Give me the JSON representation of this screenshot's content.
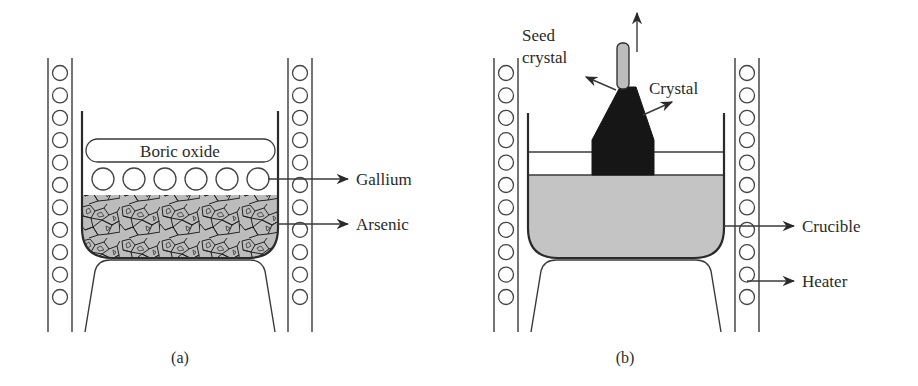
{
  "figure": {
    "panels": [
      {
        "id": "a",
        "caption": "(a)",
        "labels": {
          "boric_oxide": "Boric oxide",
          "gallium": "Gallium",
          "arsenic": "Arsenic"
        }
      },
      {
        "id": "b",
        "caption": "(b)",
        "labels": {
          "seed_line1": "Seed",
          "seed_line2": "crystal",
          "crystal": "Crystal",
          "crucible": "Crucible",
          "heater": "Heater"
        }
      }
    ],
    "heater_coil_count": 11,
    "gallium_bead_count": 6,
    "colors": {
      "line": "#2a2a2a",
      "melt_gray": "#c4c4c4",
      "seed_gray": "#bdbdbd",
      "crystal_black": "#161616",
      "arsenic_fill": "#b8b8b8",
      "background": "#ffffff"
    }
  }
}
